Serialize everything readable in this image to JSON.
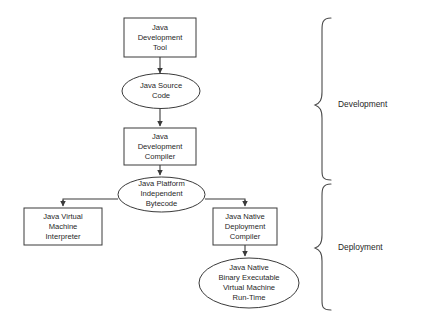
{
  "diagram": {
    "background_color": "#ffffff",
    "line_color": "#3a3a3a",
    "text_color": "#1f1f1f",
    "nodes": [
      {
        "id": "java-development-tool",
        "shape": "rectangle",
        "lines": [
          "Java",
          "Development",
          "Tool"
        ]
      },
      {
        "id": "java-source-code",
        "shape": "ellipse",
        "lines": [
          "Java Source",
          "Code"
        ]
      },
      {
        "id": "java-development-compiler",
        "shape": "rectangle",
        "lines": [
          "Java",
          "Development",
          "Compiler"
        ]
      },
      {
        "id": "java-platform-independent-bytecode",
        "shape": "ellipse",
        "lines": [
          "Java Platform",
          "Independent",
          "Bytecode"
        ]
      },
      {
        "id": "java-virtual-machine-interpreter",
        "shape": "rectangle",
        "lines": [
          "Java Virtual",
          "Machine",
          "Interpreter"
        ]
      },
      {
        "id": "java-native-deployment-compiler",
        "shape": "rectangle",
        "lines": [
          "Java Native",
          "Deployment",
          "Compiler"
        ]
      },
      {
        "id": "java-native-binary-executable",
        "shape": "ellipse",
        "lines": [
          "Java Native",
          "Binary Executable",
          "Virtual Machine",
          "Run-Time"
        ]
      }
    ],
    "braces": [
      {
        "id": "development-brace",
        "label": "Development"
      },
      {
        "id": "deployment-brace",
        "label": "Deployment"
      }
    ]
  }
}
